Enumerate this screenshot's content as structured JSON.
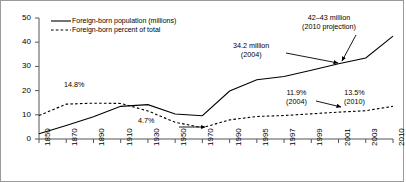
{
  "chart_data": {
    "type": "line",
    "title": "",
    "subtitle": "",
    "xlabel": "",
    "ylabel": "",
    "ylim": [
      0,
      50
    ],
    "yticks": [
      0,
      10,
      20,
      30,
      40,
      50
    ],
    "grid": false,
    "legend_position": "top-left",
    "categories": [
      "1850",
      "1870",
      "1890",
      "1910",
      "1930",
      "1950",
      "1970",
      "1990",
      "1995",
      "1997",
      "1999",
      "2001",
      "2003",
      "2010"
    ],
    "series": [
      {
        "name": "Foreign-born population (millions)",
        "style": "solid",
        "color": "#000000",
        "values": [
          2.2,
          5.6,
          9.2,
          13.5,
          14.2,
          10.3,
          9.6,
          19.8,
          24.5,
          25.8,
          28.4,
          31.1,
          33.5,
          42.5
        ]
      },
      {
        "name": "Foreign-born percent of total",
        "style": "dashed",
        "color": "#000000",
        "values": [
          9.7,
          14.4,
          14.8,
          14.7,
          11.6,
          6.9,
          4.7,
          7.9,
          9.3,
          9.7,
          10.4,
          11.1,
          11.7,
          13.5
        ]
      }
    ],
    "annotations": [
      {
        "name": "peak-percent",
        "text": "14.8%",
        "x": 1890,
        "y": 14.8
      },
      {
        "name": "trough-percent",
        "text": "4.7%",
        "x": 1970,
        "y": 4.7,
        "arrow": "right"
      },
      {
        "name": "population-2004",
        "line1": "34.2 million",
        "line2": "(2004)",
        "x": 2004,
        "y": 34.2,
        "arrow": "right"
      },
      {
        "name": "population-2010-projection",
        "line1": "42–43 million",
        "line2": "(2010 projection)",
        "x": 2010,
        "y": 42.5,
        "arrow": "down-left"
      },
      {
        "name": "percent-2004",
        "line1": "11.9%",
        "line2": "(2004)",
        "x": 2004,
        "y": 11.9,
        "arrow": "right"
      },
      {
        "name": "percent-2010",
        "line1": "13.5%",
        "line2": "(2010)",
        "x": 2010,
        "y": 13.5
      }
    ]
  },
  "legend": {
    "items": [
      {
        "label": "Foreign-born population (millions)",
        "style": "solid"
      },
      {
        "label": "Foreign-born percent of total",
        "style": "dashed"
      }
    ]
  },
  "axis": {
    "y_ticks": [
      "50",
      "40",
      "30",
      "20",
      "10",
      "0"
    ],
    "x_ticks": [
      "1850",
      "1870",
      "1890",
      "1910",
      "1930",
      "1950",
      "1970",
      "1990",
      "1995",
      "1997",
      "1999",
      "2001",
      "2003",
      "2010"
    ]
  }
}
